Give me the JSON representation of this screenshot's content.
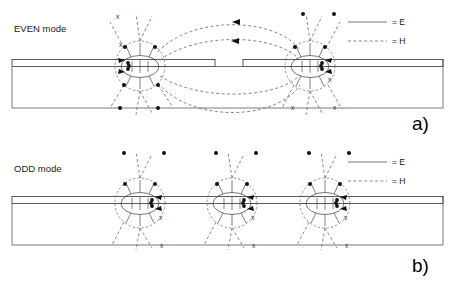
{
  "figure": {
    "width": 458,
    "height": 290,
    "background": "#ffffff"
  },
  "panels": [
    {
      "id": "panel-a",
      "mode_label": "EVEN mode",
      "caption": "a)",
      "conductor_count": 2,
      "strip_has_gap": true,
      "coupling_loops": 4,
      "legend": [
        {
          "style": "solid",
          "symbol_name": "solid-line-sample",
          "label": "= E"
        },
        {
          "style": "dashed",
          "symbol_name": "dashed-line-sample",
          "label": "= H"
        }
      ],
      "conductors": [
        {
          "cx": 140,
          "cy": 66,
          "r": 25
        },
        {
          "cx": 310,
          "cy": 66,
          "r": 25
        }
      ]
    },
    {
      "id": "panel-b",
      "mode_label": "ODD mode",
      "caption": "b)",
      "conductor_count": 3,
      "strip_has_gap": false,
      "coupling_loops": 0,
      "legend": [
        {
          "style": "solid",
          "symbol_name": "solid-line-sample",
          "label": "= E"
        },
        {
          "style": "dashed",
          "symbol_name": "dashed-line-sample",
          "label": "= H"
        }
      ],
      "conductors": [
        {
          "cx": 140,
          "cy": 203,
          "r": 25
        },
        {
          "cx": 232,
          "cy": 203,
          "r": 25
        },
        {
          "cx": 325,
          "cy": 203,
          "r": 25
        }
      ]
    }
  ],
  "markers": {
    "dot_name": "field-out-of-page-dot",
    "cross_name": "field-into-page-cross",
    "cross_glyph": "x"
  },
  "colors": {
    "background": "#ffffff",
    "e_field_line": "#3a3a3a",
    "h_field_line": "#6a6a6a",
    "substrate_outline": "#555555",
    "conductor_hatch": "#333333",
    "text": "#1a1a1a"
  }
}
